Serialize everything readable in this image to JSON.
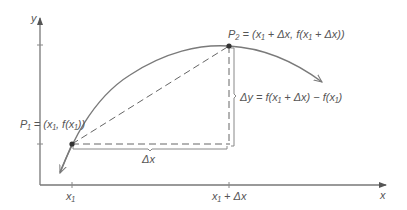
{
  "diagram": {
    "axes": {
      "x_label": "x",
      "y_label": "y"
    },
    "ticks": {
      "x1": "x₁",
      "x1_plus_dx": "x₁ + Δx"
    },
    "points": {
      "p1": {
        "name": "P₁",
        "label": "P₁ = (x₁, f(x₁))"
      },
      "p2": {
        "name": "P₂",
        "label": "P₂ = (x₁ + Δx, f(x₁ + Δx))"
      }
    },
    "delta_x_label": "Δx",
    "delta_y_label": "Δy = f(x₁ + Δx) − f(x₁)",
    "colors": {
      "curve": "#7a7a7a",
      "axis": "#555555",
      "text": "#555555",
      "point": "#333333"
    }
  }
}
